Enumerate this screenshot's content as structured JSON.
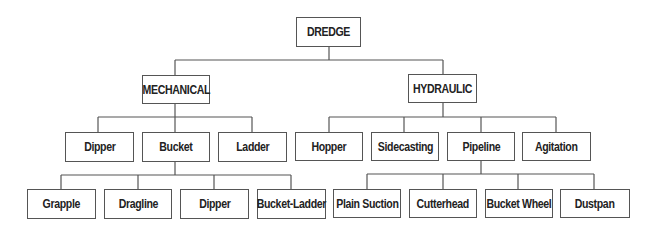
{
  "diagram": {
    "type": "tree",
    "root": {
      "label": "DREDGE",
      "children": [
        {
          "label": "MECHANICAL",
          "children": [
            {
              "label": "Dipper"
            },
            {
              "label": "Bucket",
              "children": [
                {
                  "label": "Grapple"
                },
                {
                  "label": "Dragline"
                },
                {
                  "label": "Dipper"
                },
                {
                  "label": "Bucket-Ladder"
                }
              ]
            },
            {
              "label": "Ladder"
            }
          ]
        },
        {
          "label": "HYDRAULIC",
          "children": [
            {
              "label": "Hopper"
            },
            {
              "label": "Sidecasting"
            },
            {
              "label": "Pipeline",
              "children": [
                {
                  "label": "Plain Suction"
                },
                {
                  "label": "Cutterhead"
                },
                {
                  "label": "Bucket Wheel"
                },
                {
                  "label": "Dustpan"
                }
              ]
            },
            {
              "label": "Agitation"
            }
          ]
        }
      ]
    }
  },
  "labels": {
    "dredge": "DREDGE",
    "mechanical": "MECHANICAL",
    "hydraulic": "HYDRAULIC",
    "mech_dipper": "Dipper",
    "mech_bucket": "Bucket",
    "mech_ladder": "Ladder",
    "hyd_hopper": "Hopper",
    "hyd_sidecasting": "Sidecasting",
    "hyd_pipeline": "Pipeline",
    "hyd_agitation": "Agitation",
    "bucket_grapple": "Grapple",
    "bucket_dragline": "Dragline",
    "bucket_dipper": "Dipper",
    "bucket_bucket_ladder": "Bucket-Ladder",
    "pipe_plain_suction": "Plain Suction",
    "pipe_cutterhead": "Cutterhead",
    "pipe_bucket_wheel": "Bucket Wheel",
    "pipe_dustpan": "Dustpan"
  },
  "colors": {
    "line": "#555555",
    "box_border": "#555555",
    "text": "#222222",
    "background": "#ffffff"
  }
}
